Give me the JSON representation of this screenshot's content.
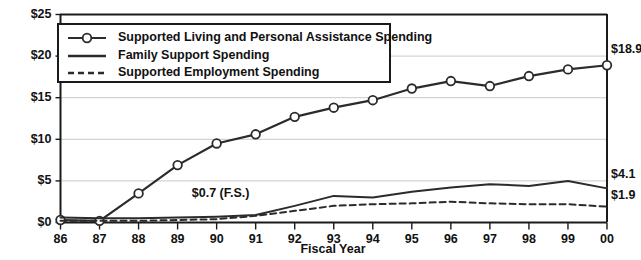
{
  "chart_data": {
    "type": "line",
    "title": "",
    "xlabel": "Fiscal Year",
    "ylabel": "",
    "categories": [
      "86",
      "87",
      "88",
      "89",
      "90",
      "91",
      "92",
      "93",
      "94",
      "95",
      "96",
      "97",
      "98",
      "99",
      "00"
    ],
    "ylim": [
      0,
      25
    ],
    "ytick_labels": [
      "$0",
      "$5",
      "$10",
      "$15",
      "$20",
      "$25"
    ],
    "ytick_values": [
      0,
      5,
      10,
      15,
      20,
      25
    ],
    "grid": true,
    "legend_position": "upper-left-inside",
    "series": [
      {
        "name": "Supported Living and Personal Assistance Spending",
        "marker": "open-circle",
        "style": "solid",
        "values": [
          0.3,
          0.2,
          3.5,
          6.9,
          9.5,
          10.6,
          12.7,
          13.8,
          14.7,
          16.1,
          17.0,
          16.4,
          17.6,
          18.4,
          18.9
        ]
      },
      {
        "name": "Family Support Spending",
        "marker": "none",
        "style": "solid",
        "values": [
          0.6,
          0.5,
          0.5,
          0.6,
          0.7,
          0.9,
          2.0,
          3.2,
          3.0,
          3.7,
          4.2,
          4.6,
          4.4,
          5.0,
          4.1
        ]
      },
      {
        "name": "Supported Employment Spending",
        "marker": "none",
        "style": "dashed",
        "values": [
          0.2,
          0.2,
          0.2,
          0.3,
          0.4,
          0.8,
          1.4,
          2.0,
          2.2,
          2.3,
          2.5,
          2.3,
          2.2,
          2.2,
          1.9
        ]
      }
    ],
    "end_labels": [
      {
        "series": "Supported Living and Personal Assistance Spending",
        "text": "$18.9"
      },
      {
        "series": "Family Support Spending",
        "text": "$4.1"
      },
      {
        "series": "Supported Employment Spending",
        "text": "$1.9"
      }
    ],
    "annotations": [
      {
        "text": "$0.7 (F.S.)",
        "at_category": "90",
        "series": "Family Support Spending"
      }
    ],
    "colors": {
      "line": "#2b2b2b",
      "grid": "#c9c9c9",
      "axis": "#1a1a1a",
      "marker_fill": "#ffffff",
      "background": "#ffffff"
    }
  },
  "legend": {
    "items": [
      {
        "label": "Supported Living and Personal Assistance Spending",
        "sample": "line-with-open-circle-marker"
      },
      {
        "label": "Family Support Spending",
        "sample": "solid-line"
      },
      {
        "label": "Supported Employment Spending",
        "sample": "dashed-line"
      }
    ]
  },
  "axes": {
    "y_labels": [
      "$25",
      "$20",
      "$15",
      "$10",
      "$5",
      "$0"
    ],
    "x_labels": [
      "86",
      "87",
      "88",
      "89",
      "90",
      "91",
      "92",
      "93",
      "94",
      "95",
      "96",
      "97",
      "98",
      "99",
      "00"
    ],
    "x_axis_title": "Fiscal Year"
  },
  "end_labels": {
    "top": "$18.9",
    "middle": "$4.1",
    "bottom": "$1.9"
  },
  "annotation": {
    "family_support": "$0.7 (F.S.)"
  },
  "cropped_title": ""
}
